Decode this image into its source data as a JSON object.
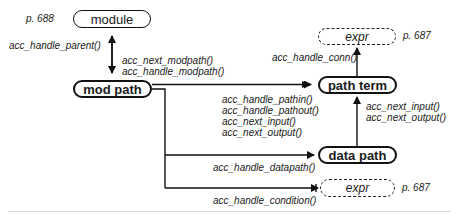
{
  "nodes": {
    "module": {
      "label": "module",
      "page_ref": "p. 688"
    },
    "mod_path": {
      "label": "mod path"
    },
    "path_term": {
      "label": "path term"
    },
    "data_path": {
      "label": "data path"
    },
    "expr_top": {
      "label": "expr",
      "page_ref": "p. 687"
    },
    "expr_bottom": {
      "label": "expr",
      "page_ref": "p. 687"
    }
  },
  "edges": {
    "module_to_modpath_up": {
      "lines": [
        "acc_handle_parent()"
      ]
    },
    "module_to_modpath_down": {
      "lines": [
        "acc_next_modpath()",
        "acc_handle_modpath()"
      ]
    },
    "modpath_to_pathterm": {
      "lines": [
        "acc_handle_pathin()",
        "acc_handle_pathout()",
        "acc_next_input()",
        "acc_next_output()"
      ]
    },
    "pathterm_to_expr": {
      "lines": [
        "acc_handle_conn()"
      ]
    },
    "datapath_to_pathterm": {
      "lines": [
        "acc_next_input()",
        "acc_next_output()"
      ]
    },
    "modpath_to_datapath": {
      "lines": [
        "acc_handle_datapath()"
      ]
    },
    "modpath_to_expr": {
      "lines": [
        "acc_handle_condition()"
      ]
    }
  }
}
